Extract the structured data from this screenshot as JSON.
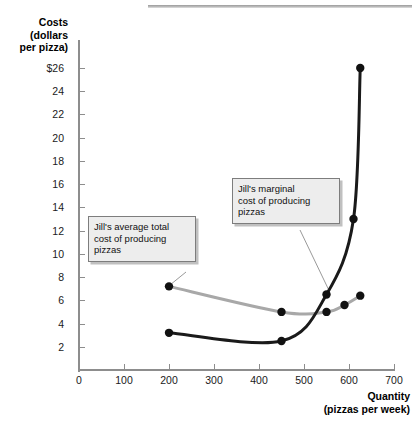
{
  "chart_data": {
    "type": "line",
    "title": "",
    "subtitle": "",
    "xlabel": "Quantity",
    "xlabel_sub": "(pizzas per week)",
    "ylabel": "Costs",
    "ylabel_sub1": "(dollars",
    "ylabel_sub2": "per pizza)",
    "xlim": [
      0,
      700
    ],
    "ylim": [
      0,
      27
    ],
    "grid": false,
    "legend": "none",
    "x_ticks": [
      0,
      100,
      200,
      300,
      400,
      500,
      600,
      700
    ],
    "x_tick_labels": [
      "0",
      "100",
      "200",
      "300",
      "400",
      "500",
      "600",
      "700"
    ],
    "y_ticks": [
      2,
      4,
      6,
      8,
      10,
      12,
      14,
      16,
      18,
      20,
      22,
      24,
      26
    ],
    "y_tick_labels": [
      "2",
      "4",
      "6",
      "8",
      "10",
      "12",
      "14",
      "16",
      "18",
      "20",
      "22",
      "24",
      "$26"
    ],
    "series": [
      {
        "name": "Jill's average total cost of producing pizzas",
        "key": "atc",
        "color": "#a8a8a8",
        "marker_color": "#111111",
        "points": [
          {
            "x": 200,
            "y": 7.2
          },
          {
            "x": 450,
            "y": 5.0
          },
          {
            "x": 550,
            "y": 5.0
          },
          {
            "x": 590,
            "y": 5.6
          },
          {
            "x": 625,
            "y": 6.4
          }
        ]
      },
      {
        "name": "Jill's marginal cost of producing pizzas",
        "key": "mc",
        "color": "#1a1a1a",
        "marker_color": "#111111",
        "points": [
          {
            "x": 200,
            "y": 3.2
          },
          {
            "x": 450,
            "y": 2.5
          },
          {
            "x": 550,
            "y": 6.5
          },
          {
            "x": 610,
            "y": 13.0
          },
          {
            "x": 625,
            "y": 26.0
          }
        ]
      }
    ],
    "annotations": [
      {
        "key": "atc",
        "line1": "Jill's average total",
        "line2": "cost of producing",
        "line3": "pizzas",
        "target": {
          "x": 200,
          "y": 7.2
        }
      },
      {
        "key": "mc",
        "line1": "Jill's marginal",
        "line2": "cost of producing",
        "line3": "pizzas",
        "target": {
          "x": 550,
          "y": 6.5
        }
      }
    ]
  },
  "axis": {
    "y_title": "Costs",
    "y_title_l2": "(dollars",
    "y_title_l3": "per pizza)",
    "x_title": "Quantity",
    "x_title_l2": "(pizzas per week)"
  },
  "callouts": {
    "atc": {
      "line1": "Jill's average total",
      "line2": "cost of producing",
      "line3": "pizzas"
    },
    "mc": {
      "line1": "Jill's marginal",
      "line2": "cost of producing",
      "line3": "pizzas"
    }
  },
  "colors": {
    "atc_curve": "#a8a8a8",
    "mc_curve": "#1a1a1a",
    "marker": "#111111",
    "axis": "#8d8d8d",
    "callout_bg": "#ededed",
    "callout_border": "#7d7d7d"
  }
}
